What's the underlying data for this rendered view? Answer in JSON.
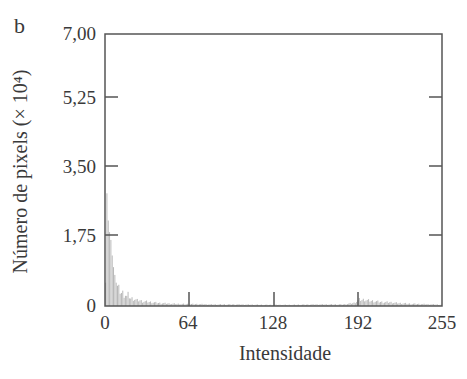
{
  "panel_label": "b",
  "chart_data": {
    "type": "bar",
    "title": "",
    "xlabel": "Intensidade",
    "ylabel": "Número de pixels (× 10⁴)",
    "xlim": [
      0,
      255
    ],
    "ylim": [
      0,
      7.0
    ],
    "xticks": [
      "0",
      "64",
      "128",
      "192",
      "255"
    ],
    "yticks": [
      "0",
      "1,75",
      "3,50",
      "5,25",
      "7,00"
    ],
    "grid": false,
    "legend": null,
    "series": [
      {
        "name": "histogram",
        "x": [
          0,
          1,
          2,
          3,
          4,
          5,
          6,
          7,
          8,
          9,
          10,
          11,
          12,
          13,
          14,
          15,
          16,
          17,
          18,
          19,
          20,
          22,
          24,
          26,
          28,
          30,
          35,
          40,
          45,
          50,
          60,
          70,
          80,
          100,
          120,
          140,
          160,
          180,
          188,
          190,
          192,
          194,
          196,
          198,
          200,
          205,
          210,
          215,
          220,
          225,
          230,
          240,
          250,
          255
        ],
        "values": [
          0.6,
          2.9,
          2.2,
          1.9,
          1.7,
          1.3,
          1.0,
          0.8,
          0.6,
          0.5,
          0.45,
          0.4,
          0.35,
          0.35,
          0.3,
          0.3,
          0.25,
          0.3,
          0.25,
          0.2,
          0.2,
          0.18,
          0.15,
          0.15,
          0.12,
          0.12,
          0.1,
          0.08,
          0.07,
          0.06,
          0.05,
          0.05,
          0.04,
          0.04,
          0.03,
          0.03,
          0.04,
          0.04,
          0.08,
          0.12,
          0.17,
          0.16,
          0.17,
          0.15,
          0.14,
          0.12,
          0.1,
          0.1,
          0.08,
          0.07,
          0.06,
          0.05,
          0.04,
          0.03
        ]
      }
    ]
  }
}
